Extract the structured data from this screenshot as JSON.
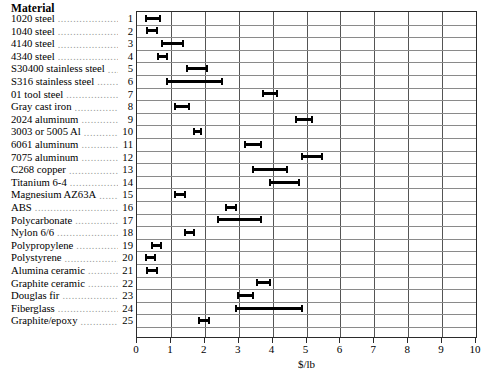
{
  "header": {
    "column_title": "Material"
  },
  "axis": {
    "xlabel": "$/lb",
    "ticks": [
      "0",
      "1",
      "2",
      "3",
      "4",
      "5",
      "6",
      "7",
      "8",
      "9",
      "10"
    ]
  },
  "chart_data": {
    "type": "bar",
    "title": "",
    "subtitle": "",
    "xlabel": "$/lb",
    "ylabel": "Material",
    "xlim": [
      0,
      10
    ],
    "grid": true,
    "legend": null,
    "orientation": "horizontal",
    "bar_style": "range-bar-with-end-caps",
    "categories": [
      "1020 steel",
      "1040 steel",
      "4140 steel",
      "4340 steel",
      "S30400 stainless steel",
      "S316 stainless steel",
      "01 tool steel",
      "Gray cast iron",
      "2024 aluminum",
      "3003 or 5005 Al",
      "6061 aluminum",
      "7075 aluminum",
      "C268 copper",
      "Titanium 6-4",
      "Magnesium AZ63A",
      "ABS",
      "Polycarbonate",
      "Nylon 6/6",
      "Polypropylene",
      "Polystyrene",
      "Alumina ceramic",
      "Graphite ceramic",
      "Douglas fir",
      "Fiberglass",
      "Graphite/epoxy"
    ],
    "indices": [
      1,
      2,
      3,
      4,
      5,
      6,
      7,
      8,
      9,
      10,
      11,
      12,
      13,
      14,
      15,
      16,
      17,
      18,
      19,
      20,
      21,
      22,
      23,
      24,
      25
    ],
    "ranges": [
      {
        "index": 1,
        "material": "1020 steel",
        "low": 0.25,
        "high": 0.7
      },
      {
        "index": 2,
        "material": "1040 steel",
        "low": 0.27,
        "high": 0.63
      },
      {
        "index": 3,
        "material": "4140 steel",
        "low": 0.7,
        "high": 1.4
      },
      {
        "index": 4,
        "material": "4340 steel",
        "low": 0.6,
        "high": 0.92
      },
      {
        "index": 5,
        "material": "S30400 stainless steel",
        "low": 1.45,
        "high": 2.1
      },
      {
        "index": 6,
        "material": "S316 stainless steel",
        "low": 0.85,
        "high": 2.55
      },
      {
        "index": 7,
        "material": "01 tool steel",
        "low": 3.7,
        "high": 4.15
      },
      {
        "index": 8,
        "material": "Gray cast iron",
        "low": 1.1,
        "high": 1.55
      },
      {
        "index": 9,
        "material": "2024 aluminum",
        "low": 4.65,
        "high": 5.2
      },
      {
        "index": 10,
        "material": "3003 or 5005 Al",
        "low": 1.65,
        "high": 1.92
      },
      {
        "index": 11,
        "material": "6061 aluminum",
        "low": 3.15,
        "high": 3.7
      },
      {
        "index": 12,
        "material": "7075 aluminum",
        "low": 4.85,
        "high": 5.5
      },
      {
        "index": 13,
        "material": "C268 copper",
        "low": 3.4,
        "high": 4.45
      },
      {
        "index": 14,
        "material": "Titanium 6-4",
        "low": 3.9,
        "high": 4.8
      },
      {
        "index": 15,
        "material": "Magnesium AZ63A",
        "low": 1.1,
        "high": 1.45
      },
      {
        "index": 16,
        "material": "ABS",
        "low": 2.6,
        "high": 2.95
      },
      {
        "index": 17,
        "material": "Polycarbonate",
        "low": 2.35,
        "high": 3.7
      },
      {
        "index": 18,
        "material": "Nylon 6/6",
        "low": 1.4,
        "high": 1.7
      },
      {
        "index": 19,
        "material": "Polypropylene",
        "low": 0.42,
        "high": 0.73
      },
      {
        "index": 20,
        "material": "Polystyrene",
        "low": 0.25,
        "high": 0.55
      },
      {
        "index": 21,
        "material": "Alumina ceramic",
        "low": 0.28,
        "high": 0.62
      },
      {
        "index": 22,
        "material": "Graphite ceramic",
        "low": 3.5,
        "high": 3.95
      },
      {
        "index": 23,
        "material": "Douglas fir",
        "low": 2.95,
        "high": 3.45
      },
      {
        "index": 24,
        "material": "Fiberglass",
        "low": 2.9,
        "high": 4.9
      },
      {
        "index": 25,
        "material": "Graphite/epoxy",
        "low": 1.8,
        "high": 2.15
      }
    ]
  },
  "colors": {
    "bar": "#000000",
    "grid": "#8a8a8a",
    "frame": "#2b2b2b",
    "leader_dots": "#9a9a9a",
    "background": "#ffffff"
  }
}
